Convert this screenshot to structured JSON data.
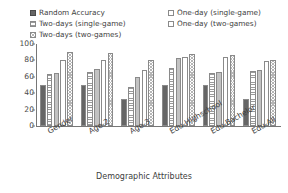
{
  "chart_data": {
    "type": "bar",
    "title": "",
    "xlabel": "Demographic Attributes",
    "ylabel": "F1-Score (%)",
    "ylim": [
      0,
      100
    ],
    "yticks": [
      0,
      20,
      40,
      60,
      80,
      100
    ],
    "grid": false,
    "legend_position": "top",
    "categories": [
      "Gender",
      "Age-2",
      "Age-3",
      "Edu-Highschool",
      "Edu-Bachelor",
      "Edu-All"
    ],
    "series": [
      {
        "name": "Random Accuracy",
        "pattern": "solid-dark",
        "values": [
          50,
          50,
          33,
          50,
          50,
          33
        ]
      },
      {
        "name": "Two-days (single-game)",
        "pattern": "h-lines",
        "values": [
          64,
          66,
          47,
          71,
          65,
          67
        ]
      },
      {
        "name": "Two-days (two-games)",
        "pattern": "checker",
        "values": [
          90,
          89,
          80,
          88,
          87,
          80
        ]
      },
      {
        "name": "One-day (single-game)",
        "pattern": "solid-light",
        "values": [
          65,
          70,
          60,
          83,
          66,
          68
        ]
      },
      {
        "name": "One-day (two-games)",
        "pattern": "white",
        "values": [
          81,
          80,
          68,
          84,
          84,
          79
        ]
      }
    ],
    "draw_order": [
      {
        "name": "Random Accuracy",
        "pattern": "solid-dark"
      },
      {
        "name": "Two-days (single-game)",
        "pattern": "h-lines"
      },
      {
        "name": "One-day (single-game)",
        "pattern": "solid-light"
      },
      {
        "name": "One-day (two-games)",
        "pattern": "white"
      },
      {
        "name": "Two-days (two-games)",
        "pattern": "checker"
      }
    ]
  },
  "legend": {
    "left_column": [
      {
        "label": "Random Accuracy",
        "pattern": "solid-dark"
      },
      {
        "label": "Two-days (single-game)",
        "pattern": "h-lines"
      },
      {
        "label": "Two-days (two-games)",
        "pattern": "checker"
      }
    ],
    "right_column": [
      {
        "label": "One-day (single-game)",
        "pattern": "white"
      },
      {
        "label": "One-day (two-games)",
        "pattern": "white"
      }
    ]
  },
  "colors": {
    "solid_dark": "#666666",
    "solid_light": "#c2c2c2",
    "outline": "#8a8a8a",
    "axis": "#777777",
    "text": "#3d3d3d",
    "background": "#ffffff"
  }
}
